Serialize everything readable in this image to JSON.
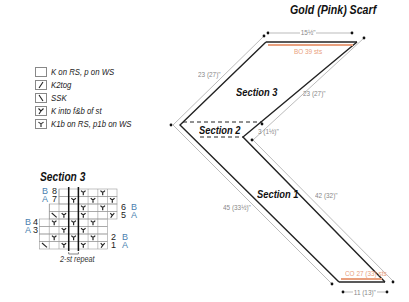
{
  "title": "Gold (Pink) Scarf",
  "legend": [
    {
      "symbol": "",
      "icon": "knit-purl-square-icon",
      "label": "K on RS, p on WS"
    },
    {
      "symbol": "⁄",
      "icon": "k2tog-icon",
      "label": "K2tog"
    },
    {
      "symbol": "⧵",
      "icon": "ssk-icon",
      "label": "SSK"
    },
    {
      "symbol": "Y",
      "icon": "kfb-icon",
      "label": "K into f&b of st"
    },
    {
      "symbol": "♥",
      "icon": "k1b-icon",
      "label": "K1b on RS, p1b on WS"
    }
  ],
  "chart": {
    "title": "Section 3",
    "repeat_label": "2-st repeat",
    "row_labels_left": {
      "r8": "8",
      "r7": "7",
      "r4": "4",
      "r3": "3"
    },
    "row_labels_right": {
      "r6": "6",
      "r5": "5",
      "r2": "2",
      "r1": "1"
    },
    "ab_left_top": {
      "b": "B",
      "a": "A"
    },
    "ab_left_mid": {
      "b": "B",
      "a": "A"
    },
    "ab_right_top": {
      "b": "B",
      "a": "A"
    },
    "ab_right_bot": {
      "b": "B",
      "a": "A"
    }
  },
  "diagram": {
    "top_width": "15½\"",
    "bind_off": "BO 39 sts",
    "section3_label": "Section 3",
    "section2_label": "Section 2",
    "section1_label": "Section 1",
    "left_upper_measure": "23 (27)\"",
    "right_upper_measure": "23 (27)\"",
    "section2_measure": "3 (1½)\"",
    "left_lower_measure": "45 (33½)\"",
    "right_lower_measure": "42 (32)\"",
    "cast_on": "CO 27 (33) sts",
    "bottom_width": "11 (13)\""
  },
  "colors": {
    "orange": "#e9a07e",
    "ab_blue": "#4a7fb0",
    "line": "#222222",
    "measure_line": "#aaaaaa"
  }
}
